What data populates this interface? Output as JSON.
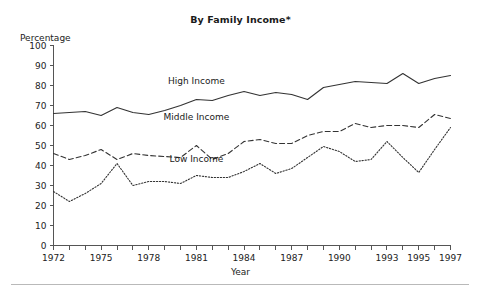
{
  "chart_data": {
    "type": "line",
    "title": "By Family Income*",
    "xlabel": "Year",
    "ylabel": "Percentage",
    "ylim": [
      0,
      100
    ],
    "xlim": [
      1972,
      1997
    ],
    "ytick_step": 10,
    "yticks": [
      0,
      10,
      20,
      30,
      40,
      50,
      60,
      70,
      80,
      90,
      100
    ],
    "ytick_labels": [
      "0",
      "10",
      "20",
      "30",
      "40",
      "50",
      "60",
      "70",
      "80",
      "90",
      "100"
    ],
    "xticks_all": [
      1972,
      1973,
      1974,
      1975,
      1976,
      1977,
      1978,
      1979,
      1980,
      1981,
      1982,
      1983,
      1984,
      1985,
      1986,
      1987,
      1988,
      1989,
      1990,
      1991,
      1992,
      1993,
      1994,
      1995,
      1996,
      1997
    ],
    "xtick_labels": [
      "1972",
      "1975",
      "1978",
      "1981",
      "1984",
      "1987",
      "1990",
      "1993",
      "1995",
      "1997"
    ],
    "xtick_label_years": [
      1972,
      1975,
      1978,
      1981,
      1984,
      1987,
      1990,
      1993,
      1995,
      1997
    ],
    "grid": false,
    "legend": "inline-labels",
    "x": [
      1972,
      1973,
      1974,
      1975,
      1976,
      1977,
      1978,
      1979,
      1980,
      1981,
      1982,
      1983,
      1984,
      1985,
      1986,
      1987,
      1988,
      1989,
      1990,
      1991,
      1992,
      1993,
      1994,
      1995,
      1996,
      1997
    ],
    "series": [
      {
        "name": "High Income",
        "style": "solid",
        "color": "#333333",
        "label_x": 1981,
        "label_y": 81,
        "values": [
          66,
          66.5,
          67,
          65,
          69,
          66.5,
          65.5,
          67.5,
          70,
          73,
          72.5,
          75,
          77,
          75,
          76.5,
          75.5,
          73,
          79,
          80.5,
          82,
          81.5,
          81,
          86,
          81,
          83.5,
          85
        ]
      },
      {
        "name": "Middle Income",
        "style": "dashed",
        "color": "#333333",
        "label_x": 1981,
        "label_y": 63,
        "values": [
          46,
          43,
          45,
          48,
          43,
          46,
          45,
          44.5,
          44,
          50,
          43,
          46,
          52,
          53,
          51,
          51,
          55,
          57,
          57,
          61,
          59,
          60,
          60,
          59,
          65.5,
          63.5
        ]
      },
      {
        "name": "Low Income",
        "style": "dotted",
        "color": "#333333",
        "label_x": 1981,
        "label_y": 42,
        "values": [
          27,
          22,
          26,
          31,
          41,
          30,
          32,
          32,
          31,
          35,
          34,
          34,
          37,
          41,
          36,
          38.5,
          44,
          49.5,
          47,
          42,
          43,
          52,
          44,
          36.5,
          48,
          59
        ]
      }
    ]
  }
}
